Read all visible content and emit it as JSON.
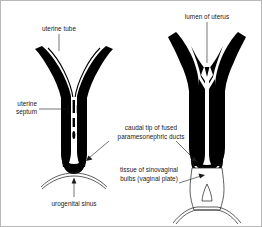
{
  "figure": {
    "background_color": "#ffffff",
    "ink_color": "#000000",
    "panels": [
      {
        "id": "left-panel",
        "name": "earlier-stage-uterovaginal-primordium",
        "labels": [
          {
            "id": "uterine-tube",
            "text": "uterine tube",
            "lines": [
              "uterine tube"
            ]
          },
          {
            "id": "uterine-septum",
            "text": "uterine septum",
            "lines": [
              "uterine",
              "septum"
            ]
          },
          {
            "id": "urogenital-sinus",
            "text": "urogenital sinus",
            "lines": [
              "urogenital sinus"
            ]
          }
        ]
      },
      {
        "id": "right-panel",
        "name": "later-stage-uterus-and-vaginal-plate",
        "labels": [
          {
            "id": "lumen-of-uterus",
            "text": "lumen of uterus",
            "lines": [
              "lumen of uterus"
            ]
          }
        ]
      }
    ],
    "shared_labels": [
      {
        "id": "caudal-tip",
        "text": "caudal tip of fused paramesonephric ducts",
        "lines": [
          "caudal tip of fused",
          "paramesonephric ducts"
        ]
      },
      {
        "id": "sinovaginal-bulbs",
        "text": "tissue of sinovaginal bulbs (vaginal plate)",
        "lines": [
          "tissue of sinovaginal",
          "bulbs (vaginal plate)"
        ]
      }
    ]
  },
  "labels": {
    "uterine_tube": "uterine tube",
    "uterine_septum_l1": "uterine",
    "uterine_septum_l2": "septum",
    "urogenital_sinus": "urogenital sinus",
    "lumen_of_uterus": "lumen of uterus",
    "caudal_tip_l1": "caudal tip of fused",
    "caudal_tip_l2": "paramesonephric ducts",
    "sinovaginal_l1": "tissue of sinovaginal",
    "sinovaginal_l2": "bulbs (vaginal plate)"
  }
}
